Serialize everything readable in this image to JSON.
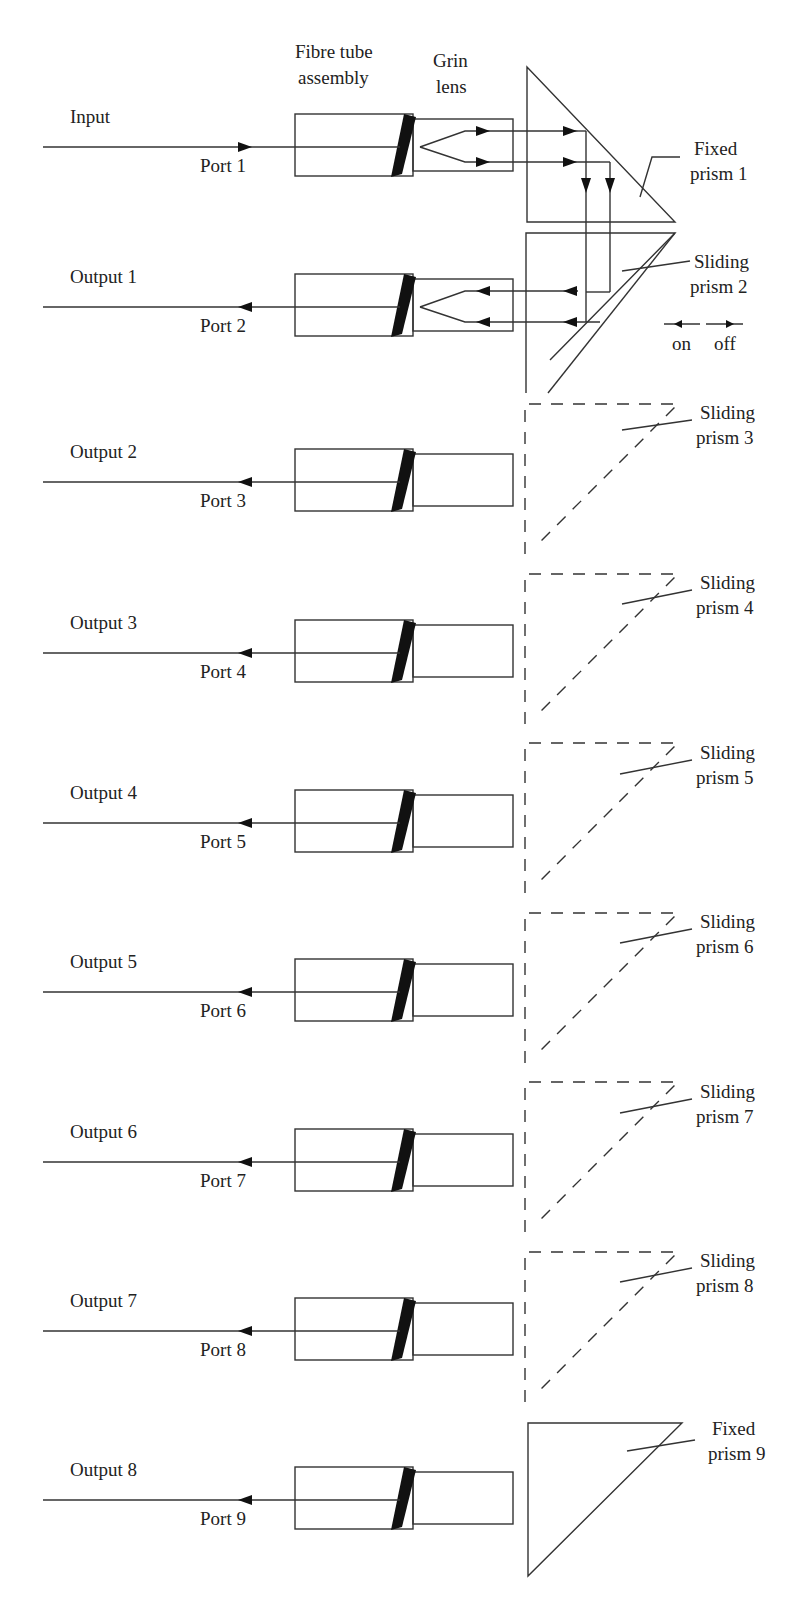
{
  "headers": {
    "fibre_tube_line1": "Fibre tube",
    "fibre_tube_line2": "assembly",
    "grin_line1": "Grin",
    "grin_line2": "lens"
  },
  "rows": [
    {
      "signal": "Input",
      "port": "Port 1",
      "y": 147
    },
    {
      "signal": "Output 1",
      "port": "Port 2",
      "y": 307
    },
    {
      "signal": "Output 2",
      "port": "Port 3",
      "y": 482
    },
    {
      "signal": "Output 3",
      "port": "Port 4",
      "y": 653
    },
    {
      "signal": "Output 4",
      "port": "Port 5",
      "y": 823
    },
    {
      "signal": "Output 5",
      "port": "Port 6",
      "y": 992
    },
    {
      "signal": "Output 6",
      "port": "Port 7",
      "y": 1162
    },
    {
      "signal": "Output 7",
      "port": "Port 8",
      "y": 1331
    },
    {
      "signal": "Output 8",
      "port": "Port 9",
      "y": 1500
    }
  ],
  "prisms": [
    {
      "line1": "Fixed",
      "line2": "prism 1",
      "type": "fixed"
    },
    {
      "line1": "Sliding",
      "line2": "prism 2",
      "type": "sliding-on"
    },
    {
      "line1": "Sliding",
      "line2": "prism 3",
      "type": "sliding-off"
    },
    {
      "line1": "Sliding",
      "line2": "prism 4",
      "type": "sliding-off"
    },
    {
      "line1": "Sliding",
      "line2": "prism 5",
      "type": "sliding-off"
    },
    {
      "line1": "Sliding",
      "line2": "prism 6",
      "type": "sliding-off"
    },
    {
      "line1": "Sliding",
      "line2": "prism 7",
      "type": "sliding-off"
    },
    {
      "line1": "Sliding",
      "line2": "prism 8",
      "type": "sliding-off"
    },
    {
      "line1": "Fixed",
      "line2": "prism 9",
      "type": "fixed"
    }
  ],
  "legend": {
    "on": "on",
    "off": "off"
  }
}
